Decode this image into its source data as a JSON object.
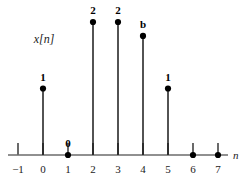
{
  "figure": {
    "signal_label": "x[n]",
    "axis_label": "n"
  },
  "chart_data": {
    "type": "scatter",
    "title": "",
    "subtitle": "",
    "xlabel": "n",
    "ylabel": "x[n]",
    "x": [
      -1,
      0,
      1,
      2,
      3,
      4,
      5,
      6,
      7
    ],
    "values": [
      null,
      1,
      0,
      2,
      2,
      "b",
      1,
      0,
      0
    ],
    "point_labels": [
      "",
      "1",
      "0",
      "2",
      "2",
      "b",
      "1",
      "",
      ""
    ],
    "xtick_labels": [
      "−1",
      "0",
      "1",
      "2",
      "3",
      "4",
      "5",
      "6",
      "7"
    ],
    "xlim": [
      -1,
      7
    ],
    "ylim": [
      0,
      2.2
    ],
    "grid": false,
    "legend": null,
    "annotations": [
      {
        "text": "x[n]",
        "x": 0.0,
        "y": 1.6
      },
      {
        "text": "n",
        "x": 7.4,
        "y": 0.0
      }
    ]
  },
  "marker_colors": {
    "dot": "#000000",
    "stem": "#1a1a1a",
    "axis": "#6b6b6b",
    "tick": "#1a1a1a"
  },
  "geometry": {
    "axis_y": 155,
    "axis_x_start": 8,
    "axis_x_end": 228,
    "tick_spacing": 25,
    "origin_x": 43,
    "tick_height": 12,
    "unit_height": 66.5,
    "dot_radius": 3.1
  }
}
